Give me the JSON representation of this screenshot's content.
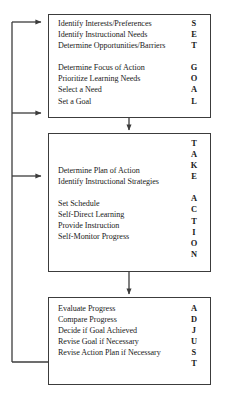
{
  "diagram": {
    "type": "flowchart",
    "orientation": "vertical",
    "line_color": "#3c3c3c",
    "background_color": "#ffffff",
    "stages": [
      {
        "id": "set-goal",
        "acronym_letters": [
          "S",
          "E",
          "T",
          "",
          "G",
          "O",
          "A",
          "L"
        ],
        "task_groups": [
          {
            "acronym": "SET",
            "tasks": [
              "Identify Interests/Preferences",
              "Identify Instructional Needs",
              "Determine Opportunities/Barriers"
            ]
          },
          {
            "acronym": "GOAL",
            "tasks": [
              "Determine Focus of Action",
              "Prioritize Learning Needs",
              "Select a Need",
              "Set a Goal"
            ]
          }
        ]
      },
      {
        "id": "take-action",
        "acronym_letters": [
          "T",
          "A",
          "K",
          "E",
          "",
          "A",
          "C",
          "T",
          "I",
          "O",
          "N"
        ],
        "task_groups": [
          {
            "acronym": "TAKE",
            "tasks": [
              "Determine Plan of Action",
              "Identify Instructional Strategies"
            ]
          },
          {
            "acronym": "ACTION",
            "tasks": [
              "Set Schedule",
              "Self-Direct Learning",
              "Provide Instruction",
              "Self-Monitor Progress"
            ]
          }
        ]
      },
      {
        "id": "adjust",
        "acronym_letters": [
          "A",
          "D",
          "J",
          "U",
          "S",
          "T"
        ],
        "task_groups": [
          {
            "acronym": "ADJUST",
            "tasks": [
              "Evaluate Progress",
              "Compare Progress",
              "Decide if Goal Achieved",
              "Revise Goal if Necessary",
              "Revise Action Plan if Necessary"
            ]
          }
        ]
      }
    ],
    "connectors": [
      {
        "id": "set-goal-to-take-action",
        "from": "set-goal",
        "to": "take-action",
        "direction": "down"
      },
      {
        "id": "take-action-to-adjust",
        "from": "take-action",
        "to": "adjust",
        "direction": "down"
      },
      {
        "id": "feedback-to-set-goal-top",
        "from": "adjust",
        "to": "set-goal",
        "direction": "right"
      },
      {
        "id": "feedback-to-set-goal-lower",
        "from": "adjust",
        "to": "set-goal",
        "direction": "right"
      },
      {
        "id": "feedback-to-take-action",
        "from": "adjust",
        "to": "take-action",
        "direction": "right"
      }
    ]
  }
}
